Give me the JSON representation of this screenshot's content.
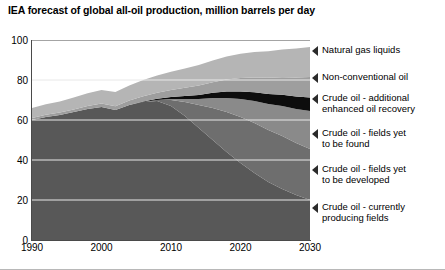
{
  "chart": {
    "title": "IEA forecast of global all-oil production, million barrels per day"
  },
  "axes": {
    "y_ticks": [
      "0",
      "20",
      "40",
      "60",
      "80",
      "100"
    ],
    "x_ticks": [
      "1990",
      "2000",
      "2010",
      "2020",
      "2030"
    ]
  },
  "legend": {
    "items": [
      {
        "label": "Natural gas liquids",
        "marker": "left-triangle-marker"
      },
      {
        "label": "Non-conventional oil",
        "marker": "left-triangle-marker"
      },
      {
        "label": "Crude oil - additional\nenhanced oil recovery",
        "marker": "left-triangle-marker"
      },
      {
        "label": "Crude oil - fields yet\nto be found",
        "marker": "left-triangle-marker"
      },
      {
        "label": "Crude oil - fields yet\nto be developed",
        "marker": "left-triangle-marker"
      },
      {
        "label": "Crude oil - currently\nproducing fields",
        "marker": "left-triangle-marker"
      }
    ]
  },
  "chart_data": {
    "type": "area",
    "stacked": true,
    "title": "IEA forecast of global all-oil production, million barrels per day",
    "xlabel": "",
    "ylabel": "million barrels per day",
    "xlim": [
      1990,
      2030
    ],
    "ylim": [
      0,
      100
    ],
    "grid": true,
    "legend_position": "right",
    "x": [
      1990,
      1992,
      1994,
      1996,
      1998,
      2000,
      2002,
      2004,
      2006,
      2008,
      2010,
      2012,
      2014,
      2016,
      2018,
      2020,
      2022,
      2024,
      2026,
      2028,
      2030
    ],
    "series": [
      {
        "name": "Crude oil - currently producing fields",
        "color": "#585858",
        "values": [
          60.0,
          61.5,
          62.5,
          64.0,
          65.5,
          66.5,
          65.0,
          67.5,
          69.0,
          69.5,
          67.0,
          62.0,
          56.0,
          50.0,
          44.0,
          38.5,
          33.5,
          29.0,
          25.5,
          22.5,
          20.0
        ]
      },
      {
        "name": "Crude oil - fields yet to be developed",
        "color": "#6e6e6e",
        "values": [
          0.0,
          0.0,
          0.0,
          0.0,
          0.0,
          0.0,
          0.0,
          0.0,
          0.0,
          0.5,
          3.0,
          7.0,
          11.5,
          16.0,
          20.0,
          23.0,
          25.0,
          26.0,
          26.5,
          26.0,
          25.5
        ]
      },
      {
        "name": "Crude oil - fields yet to be found",
        "color": "#8a8a8a",
        "values": [
          0.0,
          0.0,
          0.0,
          0.0,
          0.0,
          0.0,
          0.0,
          0.0,
          0.0,
          0.0,
          0.5,
          1.5,
          3.0,
          5.0,
          7.0,
          9.0,
          11.0,
          13.0,
          15.0,
          17.0,
          19.0
        ]
      },
      {
        "name": "Crude oil - additional enhanced oil recovery",
        "color": "#0d0d0d",
        "values": [
          0.0,
          0.0,
          0.0,
          0.0,
          0.0,
          0.0,
          0.0,
          0.0,
          0.3,
          0.6,
          1.0,
          1.5,
          2.0,
          2.6,
          3.2,
          3.8,
          4.4,
          5.0,
          5.6,
          6.2,
          6.8
        ]
      },
      {
        "name": "Non-conventional oil",
        "color": "#9e9e9e",
        "values": [
          1.0,
          1.1,
          1.2,
          1.3,
          1.5,
          1.7,
          1.9,
          2.2,
          2.6,
          3.0,
          3.5,
          4.1,
          4.7,
          5.3,
          6.0,
          6.7,
          7.4,
          8.1,
          8.8,
          9.5,
          10.2
        ]
      },
      {
        "name": "Natural gas liquids",
        "color": "#b5b5b5",
        "values": [
          5.0,
          5.3,
          5.6,
          6.0,
          6.4,
          6.8,
          7.1,
          7.6,
          8.1,
          8.6,
          9.1,
          9.7,
          10.3,
          10.9,
          11.5,
          12.1,
          12.7,
          13.3,
          13.9,
          14.5,
          15.0
        ]
      }
    ]
  }
}
